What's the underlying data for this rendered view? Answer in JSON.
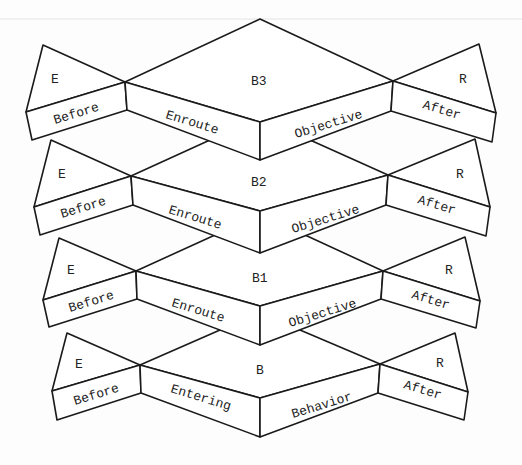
{
  "diagram": {
    "tiers": [
      {
        "id": "B3",
        "center_label": "B3",
        "left_corner": "E",
        "right_corner": "R",
        "faces": [
          "Before",
          "Enroute",
          "Objective",
          "After"
        ]
      },
      {
        "id": "B2",
        "center_label": "B2",
        "left_corner": "E",
        "right_corner": "R",
        "faces": [
          "Before",
          "Enroute",
          "Objective",
          "After"
        ]
      },
      {
        "id": "B1",
        "center_label": "B1",
        "left_corner": "E",
        "right_corner": "R",
        "faces": [
          "Before",
          "Enroute",
          "Objective",
          "After"
        ]
      },
      {
        "id": "B",
        "center_label": "B",
        "left_corner": "E",
        "right_corner": "R",
        "faces": [
          "Before",
          "Entering",
          "Behavior",
          "After"
        ]
      }
    ],
    "colors": {
      "line": "#1a1a1a",
      "fill": "#ffffff",
      "text": "#222222"
    }
  }
}
